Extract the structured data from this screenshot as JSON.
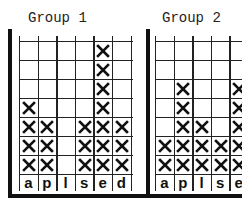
{
  "chart_data": [
    {
      "type": "table",
      "subtype": "tally-grid",
      "title": "Group 1",
      "categories": [
        "a",
        "p",
        "l",
        "s",
        "e",
        "d"
      ],
      "values": [
        4,
        3,
        0,
        3,
        7,
        3
      ],
      "rows": 7,
      "marker": "X",
      "grid": true
    },
    {
      "type": "table",
      "subtype": "tally-grid",
      "title": "Group 2",
      "categories": [
        "a",
        "p",
        "l",
        "s",
        "e"
      ],
      "values": [
        2,
        5,
        3,
        2,
        5
      ],
      "rows": 7,
      "marker": "X",
      "grid": true,
      "note": "right edge cropped"
    }
  ],
  "charts": [
    {
      "title": "Group 1",
      "labels": [
        "a",
        "p",
        "l",
        "s",
        "e",
        "d"
      ]
    },
    {
      "title": "Group 2",
      "labels": [
        "a",
        "p",
        "l",
        "s",
        "e"
      ]
    }
  ]
}
